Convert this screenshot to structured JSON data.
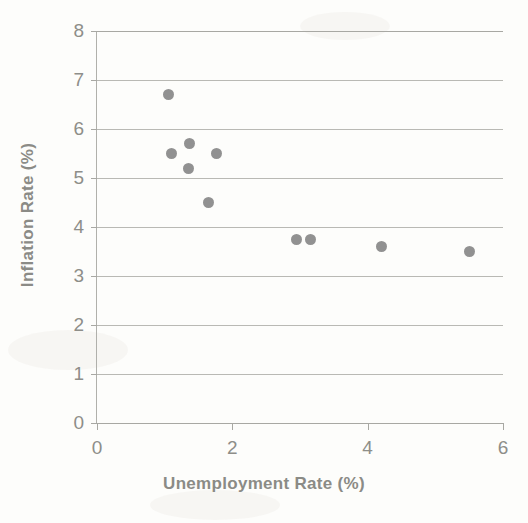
{
  "chart_data": {
    "type": "scatter",
    "title": "",
    "xlabel": "Unemployment Rate (%)",
    "ylabel": "Inflation Rate (%)",
    "xlim": [
      0,
      6
    ],
    "ylim": [
      0,
      8
    ],
    "xticks": [
      "0",
      "2",
      "4",
      "6"
    ],
    "xtick_values": [
      0,
      2,
      4,
      6
    ],
    "yticks": [
      "0",
      "1",
      "2",
      "3",
      "4",
      "5",
      "6",
      "7",
      "8"
    ],
    "ytick_values": [
      0,
      1,
      2,
      3,
      4,
      5,
      6,
      7,
      8
    ],
    "grid": "horizontal",
    "legend": "none",
    "marker_color": "#828282",
    "series": [
      {
        "name": "Observations",
        "points": [
          {
            "x": 1.05,
            "y": 6.7
          },
          {
            "x": 1.1,
            "y": 5.5
          },
          {
            "x": 1.37,
            "y": 5.7
          },
          {
            "x": 1.35,
            "y": 5.2
          },
          {
            "x": 1.77,
            "y": 5.5
          },
          {
            "x": 1.65,
            "y": 4.5
          },
          {
            "x": 2.95,
            "y": 3.75
          },
          {
            "x": 3.15,
            "y": 3.75
          },
          {
            "x": 4.2,
            "y": 3.6
          },
          {
            "x": 5.5,
            "y": 3.5
          }
        ]
      }
    ]
  }
}
